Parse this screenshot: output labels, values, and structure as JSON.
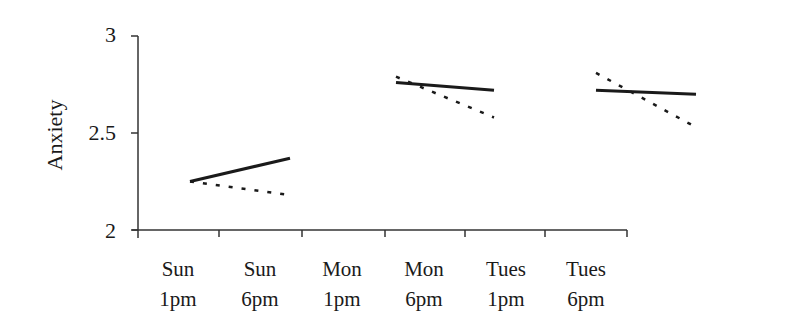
{
  "chart_data": {
    "type": "line",
    "title": "",
    "xlabel": "",
    "ylabel": "Anxiety",
    "ylim": [
      2,
      3
    ],
    "yticks": [
      "2",
      "2.5",
      "3"
    ],
    "grid": false,
    "legend": null,
    "categories": [
      {
        "line1": "Sun",
        "line2": "1pm"
      },
      {
        "line1": "Sun",
        "line2": "6pm"
      },
      {
        "line1": "Mon",
        "line2": "1pm"
      },
      {
        "line1": "Mon",
        "line2": "6pm"
      },
      {
        "line1": "Tues",
        "line2": "1pm"
      },
      {
        "line1": "Tues",
        "line2": "6pm"
      }
    ],
    "series": [
      {
        "name": "solid",
        "style": "solid",
        "segments": [
          {
            "from": "Sun 1pm",
            "to": "Sun 6pm",
            "values": [
              2.25,
              2.37
            ]
          },
          {
            "from": "Mon 1pm",
            "to": "Mon 6pm",
            "values": [
              2.76,
              2.72
            ]
          },
          {
            "from": "Tues 1pm",
            "to": "Tues 6pm",
            "values": [
              2.72,
              2.7
            ]
          }
        ]
      },
      {
        "name": "dotted",
        "style": "dotted",
        "segments": [
          {
            "from": "Sun 1pm",
            "to": "Sun 6pm",
            "values": [
              2.25,
              2.18
            ]
          },
          {
            "from": "Mon 1pm",
            "to": "Mon 6pm",
            "values": [
              2.79,
              2.58
            ]
          },
          {
            "from": "Tues 1pm",
            "to": "Tues 6pm",
            "values": [
              2.81,
              2.53
            ]
          }
        ]
      }
    ]
  },
  "colors": {
    "line": "#1a1a1a",
    "axis": "#333333",
    "background": "#ffffff"
  }
}
